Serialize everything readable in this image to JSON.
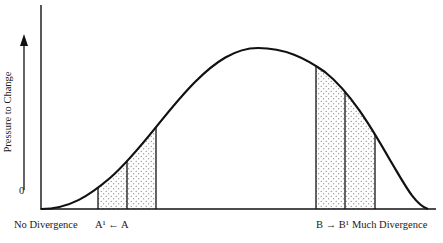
{
  "diagram": {
    "y_axis_label": "Pressure to Change",
    "y_zero_label": "0",
    "x_labels": {
      "left": "No Divergence",
      "a_group": "A¹ ← A",
      "b_group": "B → B¹",
      "right": "Much Divergence"
    },
    "colors": {
      "line": "#111111",
      "dot": "#555555",
      "background": "#ffffff"
    },
    "curve": {
      "type": "bell",
      "start_x": 41,
      "peak_x": 255,
      "end_x": 425
    },
    "shaded_regions": [
      {
        "name": "A-region",
        "dividers_x": [
          98,
          127,
          156
        ]
      },
      {
        "name": "B-region",
        "dividers_x": [
          316,
          345,
          375
        ]
      }
    ]
  }
}
